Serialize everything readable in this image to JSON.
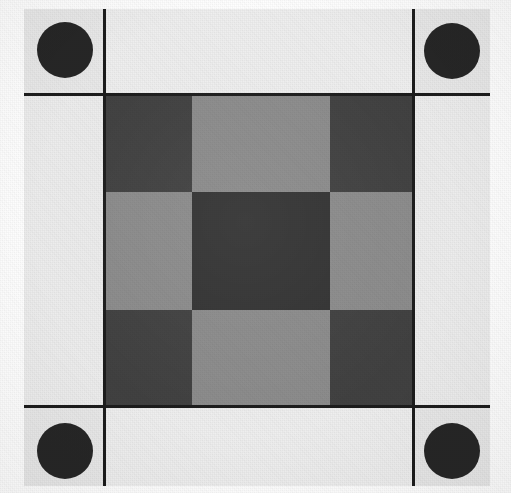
{
  "target": {
    "name": "printed-calibration-test-chart",
    "canvas": {
      "width": 511,
      "height": 493
    },
    "background_color": "#ffffff",
    "description": "Square printed test chart with four black fiducial circles at the corners and a three-by-three checkerboard of gray patches at the center on a light textured paper background."
  },
  "frame": {
    "name": "outer-border",
    "x": 24,
    "y": 9,
    "width": 466,
    "height": 477,
    "border_width": 3,
    "border_color": "#1c1c1c",
    "fill_color": "#ededed"
  },
  "colors": {
    "paper_light": "#ededed",
    "paper_light_alt": "#e8e8e8",
    "gray_mid": "#8c8c8c",
    "gray_dark": "#414141",
    "gray_center": "#333333",
    "fiducial_black": "#262626",
    "rule_black": "#1c1c1c"
  },
  "grid": {
    "name": "corner-division-rules",
    "vertical_rules_x": [
      103,
      412
    ],
    "horizontal_rules_y": [
      93,
      405
    ],
    "rule_thickness": 3,
    "rule_color": "#1c1c1c"
  },
  "fiducials": [
    {
      "name": "fiducial-top-left",
      "cx": 65,
      "cy": 50,
      "d": 56,
      "color": "#262626"
    },
    {
      "name": "fiducial-top-right",
      "cx": 452,
      "cy": 51,
      "d": 56,
      "color": "#262626"
    },
    {
      "name": "fiducial-bottom-left",
      "cx": 65,
      "cy": 451,
      "d": 56,
      "color": "#262626"
    },
    {
      "name": "fiducial-bottom-right",
      "cx": 452,
      "cy": 451,
      "d": 56,
      "color": "#262626"
    }
  ],
  "checker": {
    "name": "center-checkerboard",
    "x": 103,
    "y": 93,
    "width": 309,
    "height": 312,
    "columns_x": [
      103,
      192,
      330,
      412
    ],
    "rows_y": [
      93,
      192,
      310,
      405
    ],
    "rows": [
      [
        {
          "name": "patch-r1c1",
          "tone": "dark",
          "color": "#414141"
        },
        {
          "name": "patch-r1c2",
          "tone": "mid",
          "color": "#8c8c8c"
        },
        {
          "name": "patch-r1c3",
          "tone": "dark",
          "color": "#414141"
        }
      ],
      [
        {
          "name": "patch-r2c1",
          "tone": "mid",
          "color": "#8c8c8c"
        },
        {
          "name": "patch-r2c2",
          "tone": "center",
          "color": "#333333"
        },
        {
          "name": "patch-r2c3",
          "tone": "mid",
          "color": "#8c8c8c"
        }
      ],
      [
        {
          "name": "patch-r3c1",
          "tone": "dark",
          "color": "#414141"
        },
        {
          "name": "patch-r3c2",
          "tone": "mid",
          "color": "#8c8c8c"
        },
        {
          "name": "patch-r3c3",
          "tone": "dark",
          "color": "#414141"
        }
      ]
    ]
  },
  "margins": [
    {
      "name": "margin-top",
      "x": 103,
      "y": 9,
      "width": 309,
      "height": 84,
      "color": "#efefef"
    },
    {
      "name": "margin-bottom",
      "x": 103,
      "y": 405,
      "width": 309,
      "height": 81,
      "color": "#efefef"
    },
    {
      "name": "margin-left",
      "x": 24,
      "y": 93,
      "width": 79,
      "height": 312,
      "color": "#ededed"
    },
    {
      "name": "margin-right",
      "x": 412,
      "y": 93,
      "width": 78,
      "height": 312,
      "color": "#ededed"
    },
    {
      "name": "corner-top-left",
      "x": 24,
      "y": 9,
      "width": 79,
      "height": 84,
      "color": "#e9e9e9"
    },
    {
      "name": "corner-top-right",
      "x": 412,
      "y": 9,
      "width": 78,
      "height": 84,
      "color": "#e9e9e9"
    },
    {
      "name": "corner-bottom-left",
      "x": 24,
      "y": 405,
      "width": 79,
      "height": 81,
      "color": "#e9e9e9"
    },
    {
      "name": "corner-bottom-right",
      "x": 412,
      "y": 405,
      "width": 78,
      "height": 81,
      "color": "#e9e9e9"
    }
  ]
}
